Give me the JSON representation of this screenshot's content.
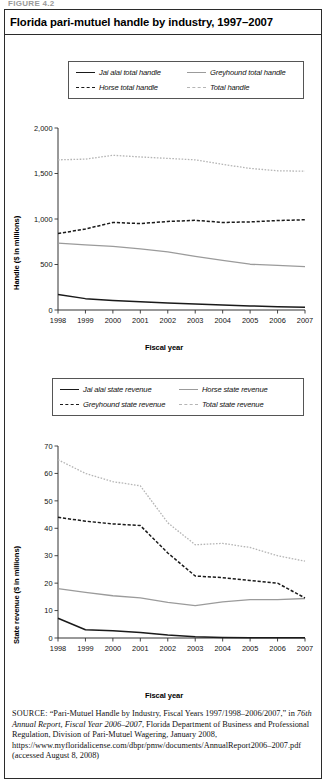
{
  "figure_tag": "FIGURE 4.2",
  "title": "Florida pari-mutuel handle by industry, 1997–2007",
  "source": {
    "label": "SOURCE:",
    "text": " “Pari-Mutuel Handle by Industry, Fiscal Years 1997/1998–2006/2007,” in ",
    "italic1": "76th Annual Report, Fiscal Year 2006–2007",
    "text2": ", Florida Department of Business and Professional Regulation, Division of Pari-Mutuel Wagering, January 2008, https://www.myfloridalicense.com/dbpr/pmw/documents/AnnualReport2006–2007.pdf (accessed August 8, 2008)"
  },
  "colors": {
    "dark": "#1a1a1a",
    "gray_solid": "#9b9b9b",
    "gray_dot": "#b5b5b5",
    "axis": "#333333",
    "frame": "#2b2b2b"
  },
  "chart_data": [
    {
      "type": "line",
      "title": "Florida pari-mutuel handle by industry, 1997–2007",
      "xlabel": "Fiscal year",
      "ylabel": "Handle ($ in millions)",
      "x": [
        1998,
        1999,
        2000,
        2001,
        2002,
        2003,
        2004,
        2005,
        2006,
        2007
      ],
      "xticklabels": [
        "1998",
        "1999",
        "2000",
        "2001",
        "2002",
        "2003",
        "2004",
        "2005",
        "2006",
        "2007"
      ],
      "yticks": [
        0,
        500,
        1000,
        1500,
        2000
      ],
      "yticklabels": [
        "0",
        "500",
        "1,000",
        "1,500",
        "2,000"
      ],
      "ylim": [
        0,
        2000
      ],
      "grid": false,
      "legend_position": "above-plot",
      "series": [
        {
          "name": "Jai alai total handle",
          "style": "solid",
          "color": "#1a1a1a",
          "width": 1.5,
          "values": [
            170,
            125,
            105,
            90,
            78,
            66,
            55,
            45,
            36,
            30
          ]
        },
        {
          "name": "Greyhound total handle",
          "style": "solid",
          "color": "#9b9b9b",
          "width": 1.3,
          "values": [
            735,
            715,
            700,
            672,
            638,
            590,
            545,
            503,
            490,
            476
          ]
        },
        {
          "name": "Horse total handle",
          "style": "dashed",
          "color": "#1a1a1a",
          "width": 1.5,
          "values": [
            840,
            890,
            962,
            950,
            973,
            985,
            962,
            968,
            983,
            992
          ]
        },
        {
          "name": "Total handle",
          "style": "dotted",
          "color": "#b5b5b5",
          "width": 1.3,
          "values": [
            1650,
            1658,
            1700,
            1682,
            1666,
            1650,
            1600,
            1556,
            1530,
            1525
          ]
        }
      ]
    },
    {
      "type": "line",
      "title": "Florida pari-mutuel state revenue by industry, 1997–2007",
      "xlabel": "Fiscal year",
      "ylabel": "State revenue ($ in millions)",
      "x": [
        1998,
        1999,
        2000,
        2001,
        2002,
        2003,
        2004,
        2005,
        2006,
        2007
      ],
      "xticklabels": [
        "1998",
        "1999",
        "2000",
        "2001",
        "2002",
        "2003",
        "2004",
        "2005",
        "2006",
        "2007"
      ],
      "yticks": [
        0,
        10,
        20,
        30,
        40,
        50,
        60,
        70
      ],
      "yticklabels": [
        "0",
        "10",
        "20",
        "30",
        "40",
        "50",
        "60",
        "70"
      ],
      "ylim": [
        0,
        70
      ],
      "grid": false,
      "legend_position": "above-plot",
      "series": [
        {
          "name": "Jai alai state revenue",
          "style": "solid",
          "color": "#1a1a1a",
          "width": 1.5,
          "values": [
            7.2,
            3.0,
            2.6,
            2.0,
            1.1,
            0.5,
            0.2,
            0.1,
            0.1,
            0.1
          ]
        },
        {
          "name": "Horse state revenue",
          "style": "solid",
          "color": "#9b9b9b",
          "width": 1.3,
          "values": [
            18.0,
            16.6,
            15.4,
            14.6,
            13.0,
            11.8,
            13.2,
            14.0,
            14.0,
            14.4
          ]
        },
        {
          "name": "Greyhound state revenue",
          "style": "dashed",
          "color": "#1a1a1a",
          "width": 1.5,
          "values": [
            44.0,
            42.6,
            41.6,
            41.0,
            31.0,
            22.6,
            22.0,
            21.0,
            20.0,
            14.6
          ]
        },
        {
          "name": "Total state revenue",
          "style": "dotted",
          "color": "#b5b5b5",
          "width": 1.3,
          "values": [
            65.0,
            60.0,
            57.0,
            55.5,
            42.0,
            34.0,
            34.5,
            33.0,
            30.0,
            28.0
          ]
        }
      ]
    }
  ],
  "chart1": {
    "legend": [
      {
        "label": "Jai alai total handle",
        "swatch": "sw-solid-dark"
      },
      {
        "label": "Greyhound total handle",
        "swatch": "sw-solid-gray"
      },
      {
        "label": "Horse total handle",
        "swatch": "sw-dash-dark"
      },
      {
        "label": "Total handle",
        "swatch": "sw-dot-gray"
      }
    ],
    "ylabel": "Handle ($ in millions)",
    "xlabel": "Fiscal year"
  },
  "chart2": {
    "legend": [
      {
        "label": "Jai alai state revenue",
        "swatch": "sw-solid-dark"
      },
      {
        "label": "Horse state revenue",
        "swatch": "sw-solid-gray"
      },
      {
        "label": "Greyhound state revenue",
        "swatch": "sw-dash-dark"
      },
      {
        "label": "Total state revenue",
        "swatch": "sw-dot-gray"
      }
    ],
    "ylabel": "State revenue ($ in millions)",
    "xlabel": "Fiscal year"
  }
}
